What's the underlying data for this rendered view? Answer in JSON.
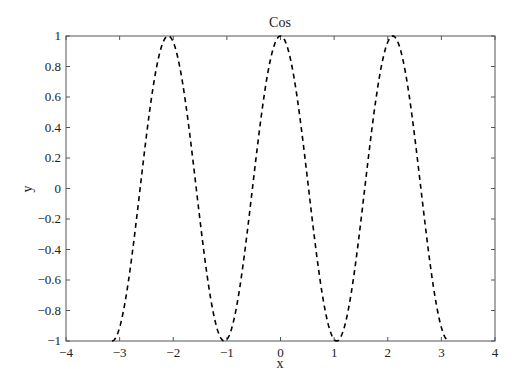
{
  "chart_data": {
    "type": "line",
    "title": "Cos",
    "xlabel": "x",
    "ylabel": "y",
    "xlim": [
      -4,
      4
    ],
    "ylim": [
      -1,
      1
    ],
    "xticks": [
      "-4",
      "-3",
      "-2",
      "-1",
      "0",
      "1",
      "2",
      "3",
      "4"
    ],
    "yticks": [
      "-1",
      "-0.8",
      "-0.6",
      "-0.4",
      "-0.2",
      "0",
      "0.2",
      "0.4",
      "0.6",
      "0.8",
      "1"
    ],
    "grid": false,
    "series": [
      {
        "name": "cos(3x)",
        "function": "cos(3x)",
        "x_range": [
          -3.1416,
          3.1416
        ],
        "style": "dashed",
        "color": "#000000",
        "x": [
          -3.1416,
          -2.0944,
          -1.0472,
          0,
          1.0472,
          2.0944,
          3.1416
        ],
        "y": [
          -1,
          1,
          -1,
          1,
          -1,
          1,
          -1
        ]
      }
    ]
  }
}
